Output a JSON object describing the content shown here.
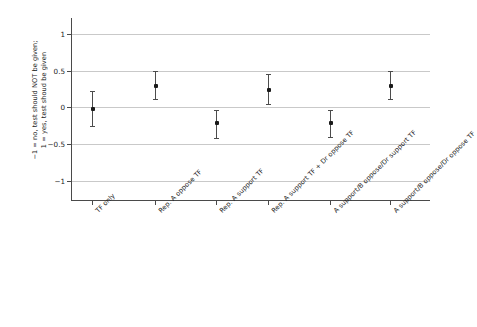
{
  "chart_data": {
    "type": "scatter",
    "title": "",
    "subtitle": "",
    "xlabel": "",
    "ylabel": "-1 = no, test should  NOT be given;\n1 = yes, test shoud be given",
    "ylabel_line1": "−1 = no, test should  NOT be given;",
    "ylabel_line2": "1 = yes, test shoud be given",
    "ylim": [
      -1.28,
      1.22
    ],
    "yticks": [
      1,
      0.5,
      0,
      -0.5,
      -1
    ],
    "ytick_labels": [
      "1",
      "0.5",
      "0",
      "−0.5",
      "−1"
    ],
    "grid": "horizontal",
    "legend": "none",
    "categories": [
      "TF only",
      "Rep. A oppose TF",
      "Rep. A support TF",
      "Rep. A support TF + Dr oppose TF",
      "A support/B oppose/Dr support TF",
      "A support/B oppose/Dr oppose TF"
    ],
    "values": [
      -0.02,
      0.29,
      -0.22,
      0.24,
      -0.21,
      0.29
    ],
    "error_low": [
      -0.26,
      0.11,
      -0.42,
      0.04,
      -0.4,
      0.11
    ],
    "error_high": [
      0.22,
      0.49,
      -0.03,
      0.45,
      -0.03,
      0.5
    ],
    "marker": "square",
    "marker_color": "#1a1a1a",
    "errorbar_color": "#4c4c4c",
    "gridline_color": "#c9c9c9",
    "axis_color": "#4a4a4a",
    "background": "#ffffff"
  }
}
